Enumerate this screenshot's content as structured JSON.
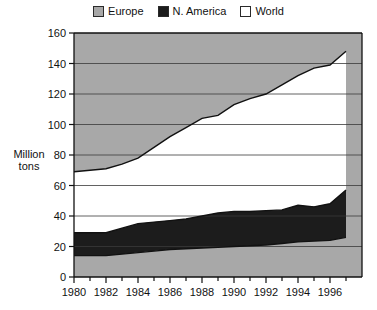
{
  "legend": {
    "position": "top-center",
    "entries": [
      {
        "label": "Europe",
        "key": "europe",
        "color": "#a8a8a8"
      },
      {
        "label": "N. America",
        "key": "namerica",
        "color": "#1c1c1c"
      },
      {
        "label": "World",
        "key": "world",
        "color": "#ffffff"
      }
    ]
  },
  "axis": {
    "ylabel_line1": "Million",
    "ylabel_line2": "tons",
    "yticks": [
      "0",
      "20",
      "40",
      "60",
      "80",
      "100",
      "120",
      "140",
      "160"
    ],
    "xticks": [
      "1980",
      "1982",
      "1984",
      "1986",
      "1988",
      "1990",
      "1992",
      "1994",
      "1996"
    ]
  },
  "chart_data": {
    "type": "area",
    "title": "",
    "subtitle": "",
    "xlabel": "",
    "ylabel": "Million tons",
    "xlim": [
      1980,
      1998
    ],
    "ylim": [
      0,
      160
    ],
    "ytick_step": 20,
    "xtick_step": 2,
    "x_minor_tick_step": 1,
    "grid": "horizontal-gridlines-only",
    "legend_position": "top-center",
    "stacking": "boundary-bands",
    "note": "Bands are read as cumulative boundaries: lower gray band (0 to series 'lower'), black band N. America (lower to namerica_top), white band World (namerica_top to world_top), upper gray fill above world_top to 160.",
    "x": [
      1980,
      1981,
      1982,
      1983,
      1984,
      1985,
      1986,
      1987,
      1988,
      1989,
      1990,
      1991,
      1992,
      1993,
      1994,
      1995,
      1996,
      1997
    ],
    "series": [
      {
        "name": "lower boundary (gray base top)",
        "values": [
          14,
          14,
          14,
          15,
          16,
          17,
          18,
          18.5,
          19,
          19.5,
          20,
          20.5,
          21,
          22,
          23,
          23.5,
          24,
          26
        ]
      },
      {
        "name": "N. America",
        "values": [
          29,
          29,
          29,
          32,
          35,
          36,
          37,
          38,
          40,
          42,
          43,
          43,
          43.5,
          44,
          47,
          46,
          48,
          57
        ]
      },
      {
        "name": "World",
        "values": [
          69,
          70,
          71,
          74,
          78,
          85,
          92,
          98,
          104,
          106,
          113,
          117,
          120,
          126,
          132,
          137,
          139,
          148
        ]
      }
    ],
    "colors": {
      "europe": "#a8a8a8",
      "namerica": "#1c1c1c",
      "world": "#ffffff",
      "outline": "#111111",
      "gridline": "#3a3a3a"
    }
  }
}
